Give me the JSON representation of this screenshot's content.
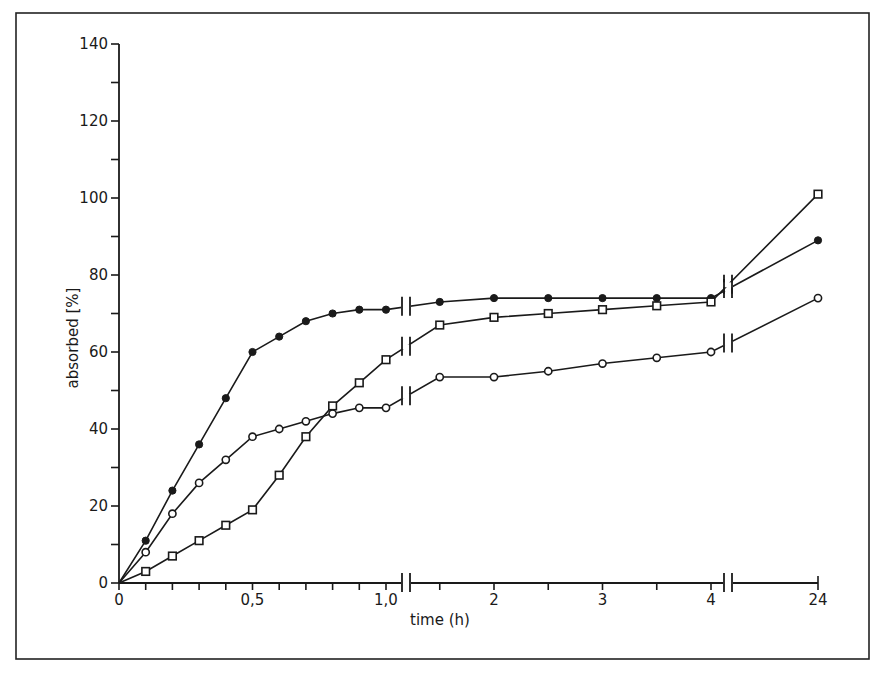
{
  "chart_data": {
    "type": "line",
    "title": "",
    "xlabel": "time (h)",
    "ylabel": "absorbed [%]",
    "ylim": [
      0,
      140
    ],
    "y_ticks": [
      0,
      20,
      40,
      60,
      80,
      100,
      120,
      140
    ],
    "y_minor_step": 10,
    "x_tick_labels": [
      {
        "value": 0,
        "label": "0"
      },
      {
        "value": 0.5,
        "label": "0,5"
      },
      {
        "value": 1.0,
        "label": "1,0"
      },
      {
        "value": 2,
        "label": "2"
      },
      {
        "value": 3,
        "label": "3"
      },
      {
        "value": 4,
        "label": "4"
      },
      {
        "value": 24,
        "label": "24"
      }
    ],
    "x_axis_breaks": [
      "between 1,0 and 2 (after 1,0)",
      "between 4 and 24"
    ],
    "grid": false,
    "legend": null,
    "x": [
      0,
      0.1,
      0.2,
      0.3,
      0.4,
      0.5,
      0.6,
      0.7,
      0.8,
      0.9,
      1.0,
      1.5,
      2,
      2.5,
      3,
      3.5,
      4,
      24
    ],
    "series": [
      {
        "name": "filled circles",
        "marker": "filled-circle",
        "values": [
          0,
          11,
          24,
          36,
          48,
          60,
          64,
          68,
          70,
          71,
          71,
          73,
          74,
          74,
          74,
          74,
          74,
          89
        ]
      },
      {
        "name": "open circles",
        "marker": "open-circle",
        "values": [
          0,
          8,
          18,
          26,
          32,
          38,
          40,
          42,
          44,
          45.5,
          45.5,
          53.5,
          53.5,
          55,
          57,
          58.5,
          60,
          74
        ]
      },
      {
        "name": "open squares",
        "marker": "open-square",
        "values": [
          0,
          3,
          7,
          11,
          15,
          19,
          28,
          38,
          46,
          52,
          58,
          67,
          69,
          70,
          71,
          72,
          73,
          101
        ]
      }
    ]
  },
  "labels": {
    "xlabel": "time (h)",
    "ylabel": "absorbed [%]"
  }
}
